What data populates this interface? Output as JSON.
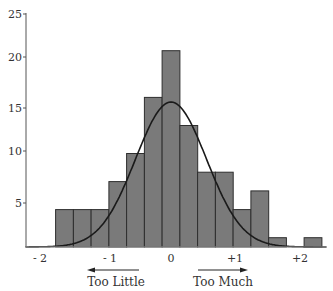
{
  "chart_data": {
    "type": "bar",
    "subtype": "histogram_with_normal_curve",
    "title": "",
    "xlabel": "",
    "ylabel": "",
    "ylim": [
      0,
      25
    ],
    "y_ticks": [
      5,
      10,
      15,
      20,
      25
    ],
    "x_ticks": [
      {
        "label": "- 2",
        "value": -2
      },
      {
        "label": "- 1",
        "value": -1
      },
      {
        "label": "0",
        "value": 0
      },
      {
        "label": "+1",
        "value": 1
      },
      {
        "label": "+2",
        "value": 2
      }
    ],
    "grid": false,
    "legend": null,
    "bin_width": 0.25,
    "bins": [
      {
        "start": -1.625,
        "value": 4
      },
      {
        "start": -1.375,
        "value": 4
      },
      {
        "start": -1.125,
        "value": 4
      },
      {
        "start": -0.875,
        "value": 7
      },
      {
        "start": -0.625,
        "value": 10
      },
      {
        "start": -0.375,
        "value": 16
      },
      {
        "start": -0.125,
        "value": 21
      },
      {
        "start": 0.125,
        "value": 13
      },
      {
        "start": 0.375,
        "value": 8
      },
      {
        "start": 0.625,
        "value": 8
      },
      {
        "start": 0.875,
        "value": 4
      },
      {
        "start": 1.125,
        "value": 6
      },
      {
        "start": 1.375,
        "value": 1
      },
      {
        "start": 1.625,
        "value": 0
      },
      {
        "start": 1.875,
        "value": 1
      }
    ],
    "categories": [
      "-1.5",
      "-1.25",
      "-1.0",
      "-0.75",
      "-0.5",
      "-0.25",
      "0",
      "0.25",
      "0.5",
      "0.75",
      "1.0",
      "1.25",
      "1.5",
      "1.75",
      "2.0"
    ],
    "values": [
      4,
      4,
      4,
      7,
      10,
      16,
      21,
      13,
      8,
      8,
      4,
      6,
      1,
      0,
      1
    ],
    "curve": {
      "type": "normal",
      "mean": 0,
      "peak": 15.5,
      "sd": 0.5
    },
    "annotations": [
      {
        "text": "Too Little",
        "arrow": "left"
      },
      {
        "text": "Too Much",
        "arrow": "right"
      }
    ]
  },
  "annotations": {
    "too_little": "Too Little",
    "too_much": "Too Much"
  },
  "style": {
    "bar_fill": "#7a7a7a",
    "bar_stroke": "#2e2e2e",
    "axis_color": "#555555",
    "curve_color": "#1a1a1a"
  }
}
